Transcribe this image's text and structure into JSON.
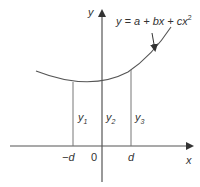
{
  "diagram": {
    "equation": {
      "prefix": "y = a + bx + cx",
      "exponent": "2"
    },
    "axes": {
      "x_label": "x",
      "y_label": "y"
    },
    "ordinates": [
      {
        "label": "y",
        "sub": "1"
      },
      {
        "label": "y",
        "sub": "2"
      },
      {
        "label": "y",
        "sub": "3"
      }
    ],
    "ticks": {
      "neg_d": "−d",
      "zero": "0",
      "pos_d": "d"
    },
    "colors": {
      "line": "#555555",
      "text": "#333333"
    }
  }
}
